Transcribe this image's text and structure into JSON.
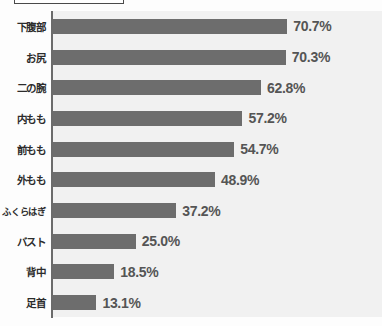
{
  "chart_data": {
    "type": "bar",
    "orientation": "horizontal",
    "title": "",
    "xlabel": "",
    "ylabel": "",
    "xlim": [
      0,
      80
    ],
    "grid": false,
    "legend": null,
    "value_suffix": "%",
    "categories": [
      "下腹部",
      "お尻",
      "二の腕",
      "内もも",
      "前もも",
      "外もも",
      "ふくらはぎ",
      "バスト",
      "背中",
      "足首"
    ],
    "values": [
      70.7,
      70.3,
      62.8,
      57.2,
      54.7,
      48.9,
      37.2,
      25.0,
      18.5,
      13.1
    ],
    "value_labels": [
      "70.7%",
      "70.3%",
      "62.8%",
      "57.2%",
      "54.7%",
      "48.9%",
      "37.2%",
      "25.0%",
      "18.5%",
      "13.1%"
    ],
    "series": [
      {
        "name": "",
        "values": [
          70.7,
          70.3,
          62.8,
          57.2,
          54.7,
          48.9,
          37.2,
          25.0,
          18.5,
          13.1
        ]
      }
    ],
    "colors": {
      "bar": "#6d6d6d",
      "plot_background": "#f1f1f1",
      "axis_line": "#6b6b6b",
      "value_text": "#555555",
      "category_text": "#2c2c2c"
    }
  }
}
